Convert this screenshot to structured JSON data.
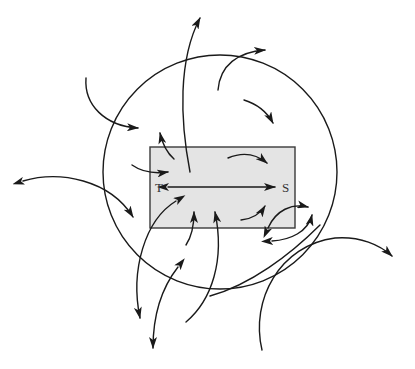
{
  "diagram": {
    "labels": {
      "left_end": "T",
      "right_end": "S"
    },
    "colors": {
      "stroke": "#1a1a1a",
      "box_fill": "#e4e4e4",
      "box_stroke": "#3a3a3a",
      "label": "#333333",
      "background": "#ffffff"
    },
    "boundary_circle": {
      "cx": 220,
      "cy": 172,
      "r": 117
    },
    "box": {
      "x": 150,
      "y": 147,
      "width": 145,
      "height": 81
    },
    "main_axis": {
      "from": "T",
      "to": "S",
      "bidirectional": true
    }
  }
}
